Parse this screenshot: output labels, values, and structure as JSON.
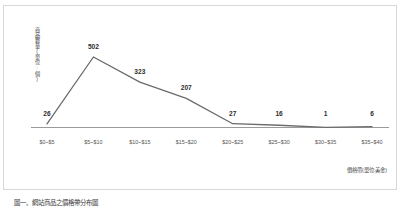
{
  "chart_data": {
    "type": "line",
    "title": "",
    "subtitle": "",
    "xlabel": "價格帶(單位:美金)",
    "ylabel": "商品數量(單位:個)",
    "categories": [
      "$0~$5",
      "$5~$10",
      "$10~$15",
      "$15~$20",
      "$20~$25",
      "$25~$30",
      "$30~$35",
      "$35~$40"
    ],
    "values": [
      26,
      502,
      323,
      207,
      27,
      16,
      1,
      6
    ],
    "data_labels": [
      "26",
      "502",
      "323",
      "207",
      "27",
      "16",
      "1",
      "6"
    ],
    "series": [
      {
        "name": "商品數量",
        "values": [
          26,
          502,
          323,
          207,
          27,
          16,
          1,
          6
        ]
      }
    ],
    "ylim": [
      0,
      560
    ],
    "grid": false,
    "legend": false,
    "legend_position": "none",
    "line_color": "#6b6b6b",
    "axis_color": "#9a9a9a",
    "label_color": "#2d2d2d",
    "background_color": "#ffffff",
    "frame_color": "#d8d8d8"
  },
  "caption": {
    "text": "圖一、網站商品之價格帶分布圖"
  }
}
